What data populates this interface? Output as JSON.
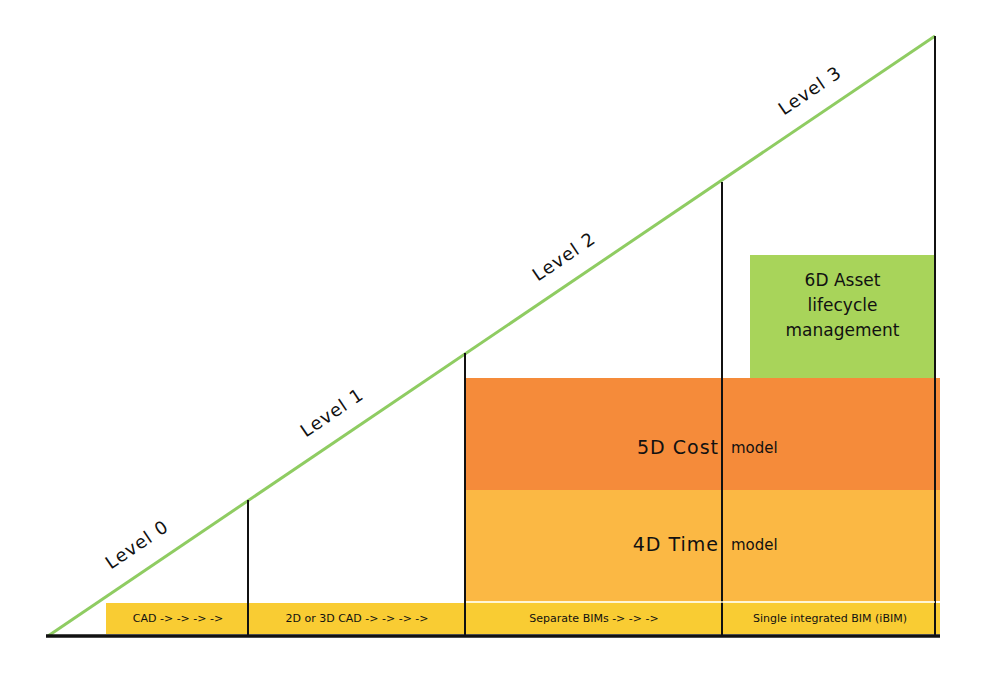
{
  "diagram": {
    "type": "bim-maturity-levels",
    "levels": [
      {
        "label": "Level 0"
      },
      {
        "label": "Level 1"
      },
      {
        "label": "Level 2"
      },
      {
        "label": "Level 3"
      }
    ],
    "base_segments": [
      {
        "label": "CAD -> -> -> ->"
      },
      {
        "label": "2D or 3D CAD -> -> -> ->"
      },
      {
        "label": "Separate BIMs -> -> ->"
      },
      {
        "label": "Single integrated BIM (iBIM)"
      }
    ],
    "layers": {
      "time": {
        "left": "4D Time",
        "right": "model"
      },
      "cost": {
        "left": "5D Cost",
        "right": "model"
      },
      "asset": {
        "line1": "6D Asset",
        "line2": "lifecycle",
        "line3": "management"
      }
    },
    "colors": {
      "hypotenuse": "#8fcc62",
      "base_band": "#f9cc33",
      "time_band": "#fbb844",
      "cost_band": "#f58b3a",
      "asset_box": "#a8d45a",
      "lines": "#111111"
    }
  }
}
